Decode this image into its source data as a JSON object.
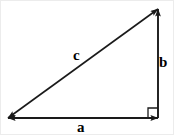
{
  "diagram": {
    "background_color": "#ffffff",
    "stroke_color": "#1a1a1a",
    "border_color": "#ececec",
    "canvas": {
      "width": 174,
      "height": 135
    },
    "vertices": {
      "bottom_left": {
        "x": 7,
        "y": 117
      },
      "bottom_right": {
        "x": 157,
        "y": 117
      },
      "top_right": {
        "x": 157,
        "y": 8
      }
    },
    "sides": [
      {
        "id": "hypotenuse",
        "label": "c",
        "name": "hypotenuse-side",
        "from": {
          "x": 7,
          "y": 117
        },
        "to": {
          "x": 157,
          "y": 8
        },
        "arrowheads": "both",
        "label_position": {
          "x": 72,
          "y": 47
        }
      },
      {
        "id": "vertical-leg",
        "label": "b",
        "name": "vertical-leg-side",
        "from": {
          "x": 157,
          "y": 117
        },
        "to": {
          "x": 157,
          "y": 8
        },
        "arrowheads": "end",
        "label_position": {
          "x": 158,
          "y": 54
        }
      },
      {
        "id": "horizontal-leg",
        "label": "a",
        "name": "horizontal-leg-side",
        "from": {
          "x": 157,
          "y": 117
        },
        "to": {
          "x": 7,
          "y": 117
        },
        "arrowheads": "both",
        "label_position": {
          "x": 76,
          "y": 119
        }
      }
    ],
    "right_angle": {
      "marker": "square",
      "at": {
        "x": 157,
        "y": 117
      },
      "size": 10
    }
  }
}
